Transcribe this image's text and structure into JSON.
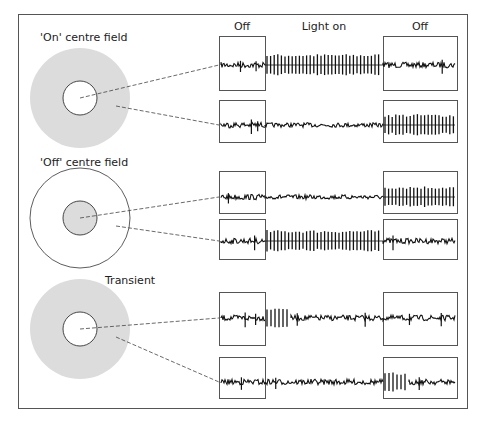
{
  "figure": {
    "colors": {
      "frame": "#555555",
      "surround_fill": "#dcdcdc",
      "centre_fill": "#ffffff",
      "ink": "#111111",
      "connector": "#444444"
    },
    "column_headers": {
      "before": "Off",
      "during": "Light on",
      "after": "Off"
    },
    "stimulus_phases": [
      "before",
      "during",
      "after"
    ],
    "cells": [
      {
        "label": "'On' centre field",
        "centre": "white",
        "surround": "grey",
        "responses": [
          {
            "stimulus": "light in centre",
            "activity": {
              "before": "background",
              "during": "high-firing",
              "after": "background"
            }
          },
          {
            "stimulus": "light in surround",
            "activity": {
              "before": "background",
              "during": "suppressed",
              "after": "high-firing"
            }
          }
        ]
      },
      {
        "label": "'Off' centre field",
        "centre": "grey",
        "surround": "white",
        "responses": [
          {
            "stimulus": "light in centre",
            "activity": {
              "before": "background",
              "during": "suppressed",
              "after": "high-firing"
            }
          },
          {
            "stimulus": "light in surround",
            "activity": {
              "before": "background",
              "during": "high-firing",
              "after": "background"
            }
          }
        ]
      },
      {
        "label": "Transient",
        "centre": "white",
        "surround": "grey",
        "responses": [
          {
            "stimulus": "light in centre",
            "activity": {
              "before": "background",
              "during": "onset-burst",
              "after": "background"
            }
          },
          {
            "stimulus": "light in surround",
            "activity": {
              "before": "background",
              "during": "background",
              "after": "offset-burst"
            }
          }
        ]
      }
    ]
  }
}
